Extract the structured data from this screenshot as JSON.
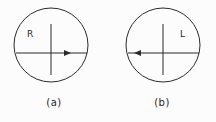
{
  "figure": {
    "background_color": "#fcfcfc",
    "line_color": "#2b2b2b",
    "text_color": "#1e1e1e",
    "panels": [
      {
        "id": "a",
        "caption": "(a)",
        "label": "R",
        "arrow_direction": "right",
        "circle": {
          "cx": 51,
          "cy": 45,
          "r": 37
        },
        "horizontal_axis": {
          "x1": 16,
          "x2": 87,
          "y": 53
        },
        "vertical_axis": {
          "x": 51,
          "y1": 24,
          "y2": 75
        },
        "label_position": {
          "x": 27,
          "y": 37
        },
        "arrow_tip": {
          "x": 71,
          "y": 53
        }
      },
      {
        "id": "b",
        "caption": "(b)",
        "label": "L",
        "arrow_direction": "left",
        "circle": {
          "cx": 55,
          "cy": 45,
          "r": 37
        },
        "horizontal_axis": {
          "x1": 20,
          "x2": 91,
          "y": 53
        },
        "vertical_axis": {
          "x": 55,
          "y1": 24,
          "y2": 75
        },
        "label_position": {
          "x": 72,
          "y": 37
        },
        "arrow_tip": {
          "x": 26,
          "y": 53
        }
      }
    ]
  }
}
